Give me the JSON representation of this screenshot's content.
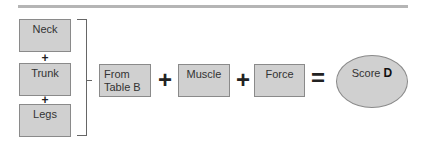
{
  "diagram": {
    "left_stack": [
      {
        "label": "Neck"
      },
      {
        "label": "Trunk"
      },
      {
        "label": "Legs"
      }
    ],
    "stack_operator": "+",
    "equation": {
      "terms": [
        {
          "label_line1": "From",
          "label_line2": "Table B"
        },
        {
          "label": "Muscle"
        },
        {
          "label": "Force"
        }
      ],
      "operator": "+",
      "equals": "=",
      "result": {
        "prefix": "Score",
        "letter": "D"
      }
    }
  }
}
